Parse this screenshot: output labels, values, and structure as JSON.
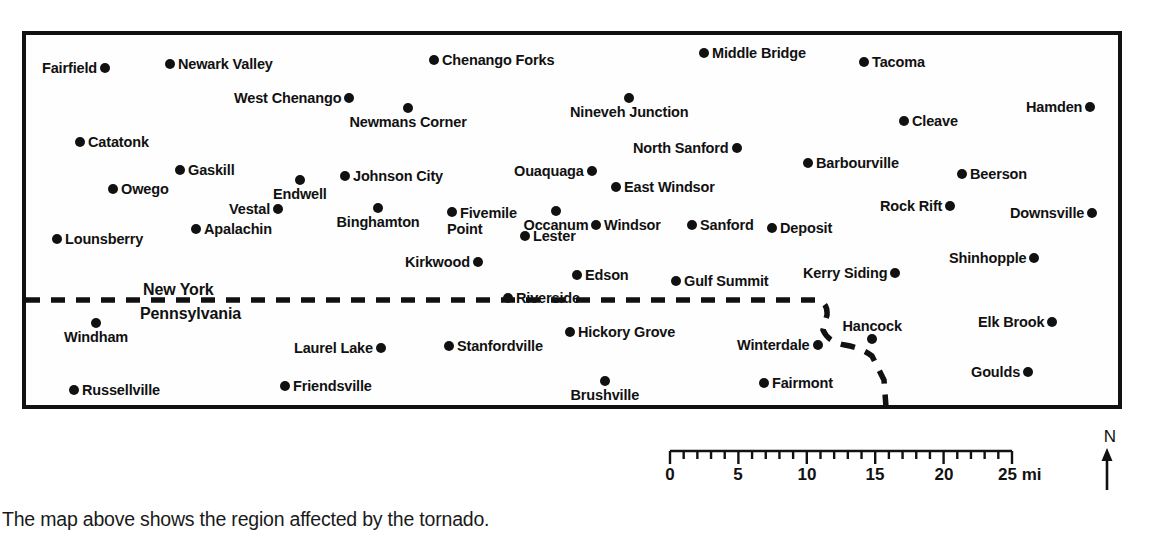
{
  "caption": "The map above shows the region affected by the tornado.",
  "colors": {
    "ink": "#111111",
    "background": "#ffffff",
    "frame": "#111111"
  },
  "map": {
    "frame": {
      "x": 22,
      "y": 31,
      "width": 1100,
      "height": 378
    },
    "state_labels": [
      {
        "name": "New York",
        "x": 143,
        "y": 281
      },
      {
        "name": "Pennsylvania",
        "x": 140,
        "y": 305
      }
    ],
    "boundary": {
      "name": "new-york-pennsylvania-border",
      "style": "dashed",
      "description": "Dashed state line running west to east, bending south near Hancock and descending to the bottom frame edge"
    },
    "cities": [
      {
        "name": "Fairfield",
        "label_side": "left",
        "dot_x": 105,
        "dot_y": 70,
        "text": "Fairfield"
      },
      {
        "name": "Newark Valley",
        "label_side": "right",
        "dot_x": 170,
        "dot_y": 66,
        "text": "Newark Valley"
      },
      {
        "name": "Chenango Forks",
        "label_side": "right",
        "dot_x": 434,
        "dot_y": 62,
        "text": "Chenango Forks"
      },
      {
        "name": "Middle Bridge",
        "label_side": "right",
        "dot_x": 704,
        "dot_y": 55,
        "text": "Middle Bridge"
      },
      {
        "name": "Tacoma",
        "label_side": "right",
        "dot_x": 864,
        "dot_y": 64,
        "text": "Tacoma"
      },
      {
        "name": "West Chenango",
        "label_side": "left",
        "dot_x": 349,
        "dot_y": 100,
        "text": "West Chenango"
      },
      {
        "name": "Nineveh Junction",
        "label_side": "below",
        "dot_x": 629,
        "dot_y": 99,
        "text": "Nineveh Junction"
      },
      {
        "name": "Newmans Corner",
        "label_side": "below",
        "dot_x": 408,
        "dot_y": 109,
        "text": "Newmans Corner"
      },
      {
        "name": "Cleave",
        "label_side": "right",
        "dot_x": 904,
        "dot_y": 123,
        "text": "Cleave"
      },
      {
        "name": "Hamden",
        "label_side": "left",
        "dot_x": 1090,
        "dot_y": 109,
        "text": "Hamden"
      },
      {
        "name": "Catatonk",
        "label_side": "right",
        "dot_x": 80,
        "dot_y": 144,
        "text": "Catatonk"
      },
      {
        "name": "North Sanford",
        "label_side": "left",
        "dot_x": 737,
        "dot_y": 150,
        "text": "North Sanford"
      },
      {
        "name": "Gaskill",
        "label_side": "right",
        "dot_x": 180,
        "dot_y": 172,
        "text": "Gaskill"
      },
      {
        "name": "Endwell",
        "label_side": "below",
        "dot_x": 300,
        "dot_y": 181,
        "text": "Endwell"
      },
      {
        "name": "Johnson City",
        "label_side": "right",
        "dot_x": 345,
        "dot_y": 178,
        "text": "Johnson City"
      },
      {
        "name": "Ouaquaga",
        "label_side": "left",
        "dot_x": 592,
        "dot_y": 173,
        "text": "Ouaquaga"
      },
      {
        "name": "Barbourville",
        "label_side": "right",
        "dot_x": 808,
        "dot_y": 165,
        "text": "Barbourville"
      },
      {
        "name": "Beerson",
        "label_side": "right",
        "dot_x": 962,
        "dot_y": 176,
        "text": "Beerson"
      },
      {
        "name": "Owego",
        "label_side": "right",
        "dot_x": 113,
        "dot_y": 191,
        "text": "Owego"
      },
      {
        "name": "East Windsor",
        "label_side": "right",
        "dot_x": 616,
        "dot_y": 189,
        "text": "East Windsor"
      },
      {
        "name": "Occanum",
        "label_side": "below",
        "dot_x": 556,
        "dot_y": 212,
        "text": "Occanum"
      },
      {
        "name": "Vestal",
        "label_side": "left",
        "dot_x": 278,
        "dot_y": 211,
        "text": "Vestal"
      },
      {
        "name": "Binghamton",
        "label_side": "below",
        "dot_x": 378,
        "dot_y": 209,
        "text": "Binghamton"
      },
      {
        "name": "Fivemile Point",
        "label_side": "right",
        "dot_x": 452,
        "dot_y": 214,
        "text": "Fivemile\nPoint"
      },
      {
        "name": "Windsor",
        "label_side": "right",
        "dot_x": 596,
        "dot_y": 227,
        "text": "Windsor"
      },
      {
        "name": "Sanford",
        "label_side": "right",
        "dot_x": 692,
        "dot_y": 227,
        "text": "Sanford"
      },
      {
        "name": "Deposit",
        "label_side": "right",
        "dot_x": 772,
        "dot_y": 230,
        "text": "Deposit"
      },
      {
        "name": "Rock Rift",
        "label_side": "left",
        "dot_x": 950,
        "dot_y": 208,
        "text": "Rock Rift"
      },
      {
        "name": "Downsville",
        "label_side": "left",
        "dot_x": 1092,
        "dot_y": 215,
        "text": "Downsville"
      },
      {
        "name": "Apalachin",
        "label_side": "right",
        "dot_x": 196,
        "dot_y": 231,
        "text": "Apalachin"
      },
      {
        "name": "Lounsberry",
        "label_side": "right",
        "dot_x": 57,
        "dot_y": 241,
        "text": "Lounsberry"
      },
      {
        "name": "Lester",
        "label_side": "right",
        "dot_x": 525,
        "dot_y": 238,
        "text": "Lester"
      },
      {
        "name": "Shinhopple",
        "label_side": "left",
        "dot_x": 1034,
        "dot_y": 260,
        "text": "Shinhopple"
      },
      {
        "name": "Kirkwood",
        "label_side": "left",
        "dot_x": 478,
        "dot_y": 264,
        "text": "Kirkwood"
      },
      {
        "name": "Edson",
        "label_side": "right",
        "dot_x": 577,
        "dot_y": 277,
        "text": "Edson"
      },
      {
        "name": "Gulf Summit",
        "label_side": "right",
        "dot_x": 676,
        "dot_y": 283,
        "text": "Gulf Summit"
      },
      {
        "name": "Kerry Siding",
        "label_side": "left",
        "dot_x": 895,
        "dot_y": 275,
        "text": "Kerry Siding"
      },
      {
        "name": "Riverside",
        "label_side": "right",
        "dot_x": 508,
        "dot_y": 300,
        "text": "Riverside"
      },
      {
        "name": "Windham",
        "label_side": "below",
        "dot_x": 96,
        "dot_y": 324,
        "text": "Windham"
      },
      {
        "name": "Hickory Grove",
        "label_side": "right",
        "dot_x": 570,
        "dot_y": 334,
        "text": "Hickory Grove"
      },
      {
        "name": "Hancock",
        "label_side": "above",
        "dot_x": 872,
        "dot_y": 340,
        "text": "Hancock"
      },
      {
        "name": "Elk Brook",
        "label_side": "left",
        "dot_x": 1052,
        "dot_y": 324,
        "text": "Elk Brook"
      },
      {
        "name": "Winterdale",
        "label_side": "left",
        "dot_x": 818,
        "dot_y": 347,
        "text": "Winterdale"
      },
      {
        "name": "Laurel Lake",
        "label_side": "left",
        "dot_x": 381,
        "dot_y": 350,
        "text": "Laurel Lake"
      },
      {
        "name": "Stanfordville",
        "label_side": "right",
        "dot_x": 449,
        "dot_y": 348,
        "text": "Stanfordville"
      },
      {
        "name": "Goulds",
        "label_side": "left",
        "dot_x": 1028,
        "dot_y": 374,
        "text": "Goulds"
      },
      {
        "name": "Russellville",
        "label_side": "right",
        "dot_x": 74,
        "dot_y": 392,
        "text": "Russellville"
      },
      {
        "name": "Friendsville",
        "label_side": "right",
        "dot_x": 285,
        "dot_y": 388,
        "text": "Friendsville"
      },
      {
        "name": "Fairmont",
        "label_side": "right",
        "dot_x": 764,
        "dot_y": 385,
        "text": "Fairmont"
      },
      {
        "name": "Brushville",
        "label_side": "below",
        "dot_x": 605,
        "dot_y": 382,
        "text": "Brushville"
      }
    ]
  },
  "scale": {
    "unit": "mi",
    "unit_label": "25 mi",
    "min": 0,
    "max": 25,
    "major_ticks": [
      0,
      5,
      10,
      15,
      20,
      25
    ],
    "minor_tick_interval": 1,
    "tick_labels": [
      "0",
      "5",
      "10",
      "15",
      "20",
      "25"
    ]
  },
  "compass": {
    "label": "N",
    "direction": "up"
  }
}
